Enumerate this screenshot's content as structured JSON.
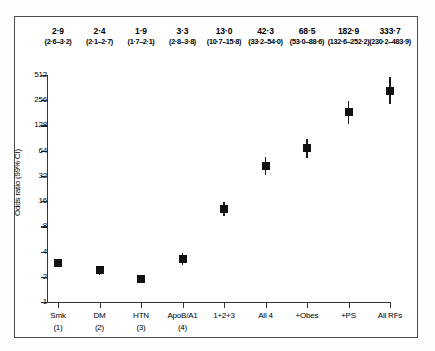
{
  "figure": {
    "y_axis_title": "Odds ratio (99% CI)",
    "y_ticks": [
      "512",
      "256",
      "128",
      "64",
      "32",
      "16",
      "8",
      "4",
      "2",
      "1"
    ]
  },
  "chart_data": {
    "type": "scatter",
    "title": "",
    "xlabel": "",
    "ylabel": "Odds ratio (99% CI)",
    "yscale": "log2",
    "ylim": [
      1,
      512
    ],
    "grid": false,
    "legend": null,
    "categories": [
      "Smk (1)",
      "DM (2)",
      "HTN (3)",
      "ApoB/A1 (4)",
      "1+2+3",
      "All 4",
      "+Obes",
      "+PS",
      "All RFs"
    ],
    "values": [
      2.9,
      2.4,
      1.9,
      3.3,
      13.0,
      42.3,
      68.5,
      182.9,
      333.7
    ],
    "ci_low": [
      2.6,
      2.1,
      1.7,
      2.8,
      10.7,
      33.2,
      53.0,
      132.6,
      230.2
    ],
    "ci_high": [
      3.2,
      2.7,
      2.1,
      3.8,
      15.8,
      54.0,
      88.6,
      252.2,
      483.9
    ],
    "point_labels": [
      "2·9",
      "2·4",
      "1·9",
      "3·3",
      "13·0",
      "42·3",
      "68·5",
      "182·9",
      "333·7"
    ],
    "ci_labels": [
      "(2·6–3·2)",
      "(2·1–2·7)",
      "(1·7–2·1)",
      "(2·8–3·8)",
      "(10·7–15·8)",
      "(33·2–54·0)",
      "(53·0–88·6)",
      "(132·6–252·2)",
      "(230·2–483·9)"
    ],
    "x_labels": [
      {
        "name": "Smk",
        "sub": "(1)"
      },
      {
        "name": "DM",
        "sub": "(2)"
      },
      {
        "name": "HTN",
        "sub": "(3)"
      },
      {
        "name": "ApoB/A1",
        "sub": "(4)"
      },
      {
        "name": "1+2+3",
        "sub": ""
      },
      {
        "name": "All 4",
        "sub": ""
      },
      {
        "name": "+Obes",
        "sub": ""
      },
      {
        "name": "+PS",
        "sub": ""
      },
      {
        "name": "All RFs",
        "sub": ""
      }
    ],
    "marker_color": "#111111",
    "axis_color": "#333333"
  }
}
